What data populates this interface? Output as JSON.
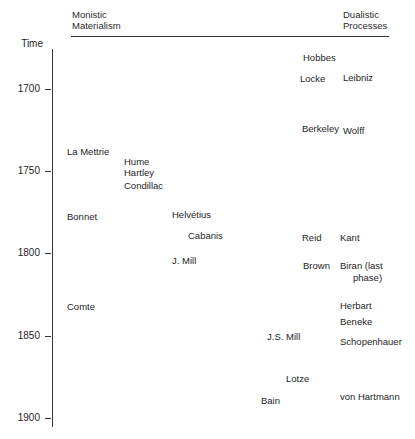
{
  "headers": {
    "left": [
      "Monistic",
      "Materialism"
    ],
    "right": [
      "Dualistic",
      "Processes"
    ]
  },
  "axis": {
    "title": "Time",
    "ticks": [
      "1700",
      "1750",
      "1800",
      "1850",
      "1900"
    ]
  },
  "names": {
    "hobbes": "Hobbes",
    "locke": "Locke",
    "leibniz": "Leibniz",
    "berkeley": "Berkeley",
    "wolff": "Wolff",
    "la_mettrie": "La Mettrie",
    "hume": "Hume",
    "hartley": "Hartley",
    "condillac": "Condillac",
    "bonnet": "Bonnet",
    "helvetius": "Helvétius",
    "cabanis": "Cabanis",
    "reid": "Reid",
    "kant": "Kant",
    "j_mill": "J. Mill",
    "brown": "Brown",
    "biran_line1": "Biran (last",
    "biran_line2": "phase)",
    "comte": "Comte",
    "herbart": "Herbart",
    "beneke": "Beneke",
    "js_mill": "J.S. Mill",
    "schopenhauer": "Schopenhauer",
    "lotze": "Lotze",
    "bain": "Bain",
    "von_hartmann": "von Hartmann"
  }
}
